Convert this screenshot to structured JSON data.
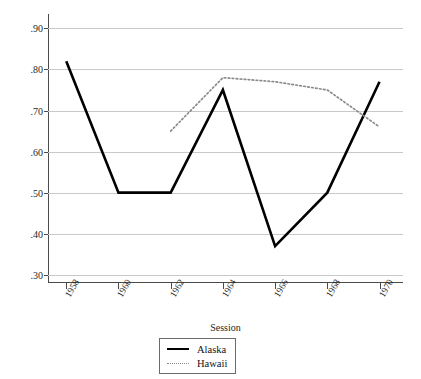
{
  "chart_data": {
    "type": "line",
    "title": "",
    "xlabel": "Session",
    "ylabel": "Mean % of Dems in House",
    "x": [
      1958,
      1960,
      1962,
      1964,
      1966,
      1968,
      1970
    ],
    "xtick_labels": [
      "1958",
      "1960",
      "1962",
      "1964",
      "1966",
      "1968",
      "1970"
    ],
    "ytick_labels": [
      ".90",
      ".80",
      ".70",
      ".60",
      ".50",
      ".40",
      ".30"
    ],
    "ytick_values": [
      0.9,
      0.8,
      0.7,
      0.6,
      0.5,
      0.4,
      0.3
    ],
    "ylim": [
      0.28,
      0.935
    ],
    "xlim": [
      1957.3,
      1970.9
    ],
    "grid": true,
    "legend_position": "bottom-center",
    "series": [
      {
        "name": "Alaska",
        "style": "solid",
        "color": "#000000",
        "x": [
          1958,
          1960,
          1962,
          1964,
          1966,
          1968,
          1970
        ],
        "values": [
          0.82,
          0.5,
          0.5,
          0.75,
          0.37,
          0.5,
          0.77
        ]
      },
      {
        "name": "Hawaii",
        "style": "dotted",
        "color": "#8a8a8a",
        "x": [
          1962,
          1964,
          1966,
          1968,
          1970
        ],
        "values": [
          0.65,
          0.78,
          0.77,
          0.75,
          0.66
        ]
      }
    ]
  },
  "legend": {
    "items": [
      {
        "label": "Alaska",
        "style": "solid"
      },
      {
        "label": "Hawaii",
        "style": "dotted"
      }
    ]
  }
}
